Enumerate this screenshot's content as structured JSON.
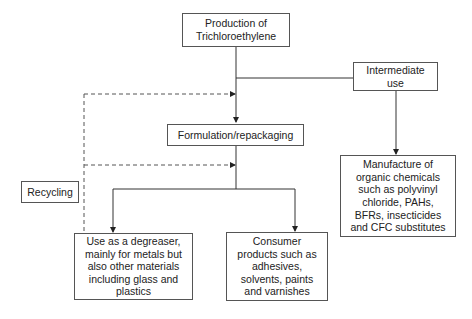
{
  "diagram": {
    "type": "flowchart",
    "nodes": {
      "production": {
        "label": "Production of\nTrichloroethylene"
      },
      "intermediate": {
        "label": "Intermediate\nuse"
      },
      "formulation": {
        "label": "Formulation/repackaging"
      },
      "recycling": {
        "label": "Recycling"
      },
      "manufacture": {
        "label": "Manufacture of\norganic chemicals\nsuch as polyvinyl\nchloride, PAHs,\nBFRs, insecticides\nand CFC substitutes"
      },
      "degreaser": {
        "label": "Use as a degreaser,\nmainly for metals but\nalso other materials\nincluding glass and\nplastics"
      },
      "consumer": {
        "label": "Consumer\nproducts such as\nadhesives,\nsolvents, paints\nand varnishes"
      }
    },
    "edges": [
      {
        "from": "production",
        "to": "formulation",
        "style": "solid"
      },
      {
        "from": "production",
        "to": "intermediate",
        "style": "solid"
      },
      {
        "from": "intermediate",
        "to": "manufacture",
        "style": "solid"
      },
      {
        "from": "formulation",
        "to": "degreaser",
        "style": "solid"
      },
      {
        "from": "formulation",
        "to": "consumer",
        "style": "solid"
      },
      {
        "from": "recycling",
        "to": "formulation-input",
        "style": "dashed"
      },
      {
        "from": "recycling",
        "to": "formulation-output",
        "style": "dashed"
      }
    ],
    "colors": {
      "line": "#333333",
      "border": "#555555",
      "text": "#222222",
      "background": "#ffffff"
    }
  }
}
